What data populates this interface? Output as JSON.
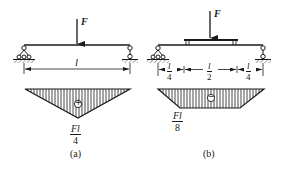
{
  "colors": {
    "ink": "#1a1a1a",
    "background": "#ffffff"
  },
  "diagram_a": {
    "caption": "(a)",
    "force_label": "F",
    "span_label": "l",
    "moment_sign": "+",
    "moment_max": {
      "numerator": "Fl",
      "denominator": "4"
    }
  },
  "diagram_b": {
    "caption": "(b)",
    "force_label": "F",
    "segments": [
      {
        "numerator": "l",
        "denominator": "4"
      },
      {
        "numerator": "l",
        "denominator": "2"
      },
      {
        "numerator": "l",
        "denominator": "4"
      }
    ],
    "moment_sign": "−",
    "moment_max": {
      "numerator": "Fl",
      "denominator": "8"
    }
  }
}
